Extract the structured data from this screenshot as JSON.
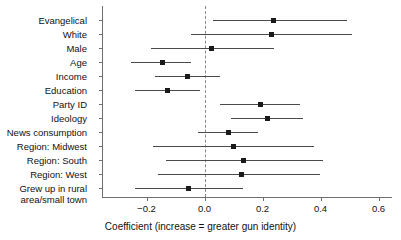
{
  "chart_data": {
    "type": "scatter",
    "title": "",
    "xlabel": "Coefficient (increase = greater gun identity)",
    "ylabel": "",
    "xlim": [
      -0.35,
      0.65
    ],
    "xticks": [
      -0.2,
      0.0,
      0.2,
      0.4,
      0.6
    ],
    "xticklabels": [
      "−0.2",
      "0.0",
      "0.2",
      "0.4",
      "0.6"
    ],
    "grid": false,
    "legend": null,
    "reference_line": 0.0,
    "categories": [
      "Evangelical",
      "White",
      "Male",
      "Age",
      "Income",
      "Education",
      "Party ID",
      "Ideology",
      "News consumption",
      "Region: Midwest",
      "Region: South",
      "Region: West",
      "Grew up in rural area/small town"
    ],
    "points": [
      {
        "label": "Evangelical",
        "value": 0.238,
        "low": 0.031,
        "high": 0.493
      },
      {
        "label": "White",
        "value": 0.231,
        "low": -0.048,
        "high": 0.51
      },
      {
        "label": "Male",
        "value": 0.024,
        "low": -0.186,
        "high": 0.238
      },
      {
        "label": "Age",
        "value": -0.145,
        "low": -0.255,
        "high": -0.045
      },
      {
        "label": "Income",
        "value": -0.059,
        "low": -0.169,
        "high": 0.055
      },
      {
        "label": "Education",
        "value": -0.128,
        "low": -0.238,
        "high": -0.014
      },
      {
        "label": "Party ID",
        "value": 0.193,
        "low": 0.052,
        "high": 0.331
      },
      {
        "label": "Ideology",
        "value": 0.217,
        "low": 0.09,
        "high": 0.341
      },
      {
        "label": "News consumption",
        "value": 0.083,
        "low": -0.021,
        "high": 0.186
      },
      {
        "label": "Region: Midwest",
        "value": 0.1,
        "low": -0.176,
        "high": 0.376
      },
      {
        "label": "Region: South",
        "value": 0.134,
        "low": -0.134,
        "high": 0.407
      },
      {
        "label": "Region: West",
        "value": 0.128,
        "low": -0.159,
        "high": 0.4
      },
      {
        "label": "Grew up in rural area/small town",
        "value": -0.055,
        "low": -0.238,
        "high": 0.134
      }
    ],
    "colors": {
      "point": "#1a1a1a",
      "interval": "#4a4a4a",
      "axis": "#6f6f6f",
      "reference": "#8a8a8a",
      "text": "#111111",
      "background": "#ffffff"
    }
  },
  "axis_labels": {
    "x_title": "Coefficient (increase = greater gun identity)"
  },
  "category_display": [
    {
      "lines": [
        "Evangelical"
      ]
    },
    {
      "lines": [
        "White"
      ]
    },
    {
      "lines": [
        "Male"
      ]
    },
    {
      "lines": [
        "Age"
      ]
    },
    {
      "lines": [
        "Income"
      ]
    },
    {
      "lines": [
        "Education"
      ]
    },
    {
      "lines": [
        "Party ID"
      ]
    },
    {
      "lines": [
        "Ideology"
      ]
    },
    {
      "lines": [
        "News consumption"
      ]
    },
    {
      "lines": [
        "Region: Midwest"
      ]
    },
    {
      "lines": [
        "Region: South"
      ]
    },
    {
      "lines": [
        "Region: West"
      ]
    },
    {
      "lines": [
        "Grew up in rural",
        "area/small town"
      ]
    }
  ]
}
